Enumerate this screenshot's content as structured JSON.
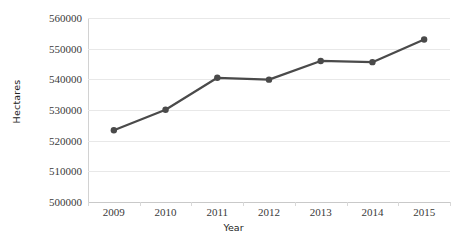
{
  "chart_data": {
    "type": "line",
    "title": "",
    "xlabel": "Year",
    "ylabel": "Hectares",
    "categories": [
      "2009",
      "2010",
      "2011",
      "2012",
      "2013",
      "2014",
      "2015"
    ],
    "values": [
      523400,
      530100,
      540500,
      539900,
      546000,
      545600,
      553000
    ],
    "series": [
      {
        "name": "Hectares",
        "values": [
          523400,
          530100,
          540500,
          539900,
          546000,
          545600,
          553000
        ]
      }
    ],
    "ylim": [
      500000,
      560000
    ],
    "ytick_step": 10000,
    "yticks": [
      500000,
      510000,
      520000,
      530000,
      540000,
      550000,
      560000
    ],
    "ytick_labels": [
      "500000",
      "510000",
      "520000",
      "530000",
      "540000",
      "550000",
      "560000"
    ],
    "grid": true,
    "grid_axis": "y",
    "legend": false,
    "legend_position": "none",
    "marker": "circle",
    "colors": {
      "line": "#4a4a4a",
      "marker": "#4a4a4a",
      "grid": "#e8e8e8",
      "axis": "#c9c9c9",
      "background": "#ffffff",
      "text": "#3a3a3a"
    }
  }
}
